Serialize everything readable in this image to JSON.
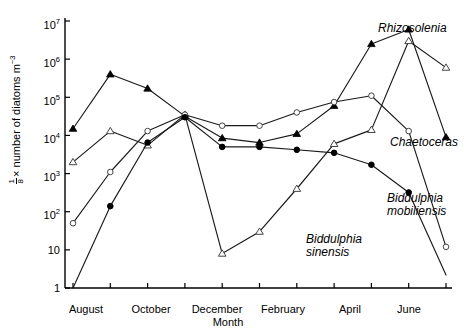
{
  "chart_data": {
    "type": "line",
    "title": "",
    "xlabel": "Month",
    "ylabel": "1/8 × number of diatoms m⁻³",
    "y_scale": "log",
    "ylim": [
      1,
      10000000
    ],
    "y_ticks": [
      {
        "value": 10000000,
        "label": "10",
        "exp": "7"
      },
      {
        "value": 1000000,
        "label": "10",
        "exp": "6"
      },
      {
        "value": 100000,
        "label": "10",
        "exp": "5"
      },
      {
        "value": 10000,
        "label": "10",
        "exp": "4"
      },
      {
        "value": 1000,
        "label": "10",
        "exp": "3"
      },
      {
        "value": 100,
        "label": "10",
        "exp": "2"
      },
      {
        "value": 10,
        "label": "10",
        "exp": ""
      },
      {
        "value": 1,
        "label": "1",
        "exp": ""
      }
    ],
    "x_tick_labels": [
      "August",
      "October",
      "December",
      "February",
      "April",
      "June"
    ],
    "x_months": [
      "Aug",
      "Sep",
      "Oct",
      "Nov",
      "Dec",
      "Jan",
      "Feb",
      "Mar",
      "Apr",
      "May",
      "Jun"
    ],
    "grid": false,
    "legend_position": "inline-right",
    "series": [
      {
        "name": "Chaetoceras",
        "marker": "filled-triangle",
        "x": [
          0,
          1,
          2,
          3,
          4,
          5,
          6,
          7,
          8,
          9,
          10
        ],
        "values": [
          15000,
          400000,
          170000,
          32000,
          8500,
          6500,
          11000,
          60000,
          2500000,
          6000000,
          9000
        ],
        "label_x": 396,
        "label_y": 142
      },
      {
        "name": "Rhizosolenia",
        "marker": "open-triangle",
        "x": [
          0,
          1,
          2,
          3,
          4,
          5,
          6,
          7,
          8,
          9,
          10
        ],
        "values": [
          2000,
          13000,
          5500,
          35000,
          8,
          30,
          400,
          6000,
          14000,
          3000000,
          600000
        ],
        "label_x": 378,
        "label_y": 29
      },
      {
        "name": "Biddulphia mobiliensis",
        "marker": "open-circle",
        "x": [
          0,
          1,
          2,
          3,
          4,
          5,
          6,
          7,
          8,
          9,
          10
        ],
        "values": [
          50,
          1100,
          13000,
          35000,
          18000,
          18000,
          40000,
          75000,
          110000,
          13000,
          12
        ],
        "label_x": 392,
        "label_y": 200
      },
      {
        "name": "Biddulphia sinensis",
        "marker": "filled-circle",
        "x": [
          0,
          1,
          2,
          3,
          4,
          5,
          6,
          7,
          8,
          9,
          10
        ],
        "values": [
          1,
          140,
          6500,
          30000,
          5000,
          5000,
          4200,
          3500,
          1700,
          320,
          2.2
        ],
        "label_x": 310,
        "label_y": 240
      }
    ],
    "series_labels": [
      {
        "name": "Rhizosolenia",
        "lines": [
          "Rhizosolenia"
        ]
      },
      {
        "name": "Chaetoceras",
        "lines": [
          "Chaetoceras"
        ]
      },
      {
        "name": "Biddulphia mobiliensis",
        "lines": [
          "Biddulphia",
          "mobiliensis"
        ]
      },
      {
        "name": "Biddulphia sinensis",
        "lines": [
          "Biddulphia",
          "sinensis"
        ]
      }
    ],
    "colors": {
      "axis": "#000000",
      "line": "#1a1a1a",
      "marker_fill": "#000000",
      "marker_open": "#ffffff",
      "background": "#ffffff"
    }
  }
}
